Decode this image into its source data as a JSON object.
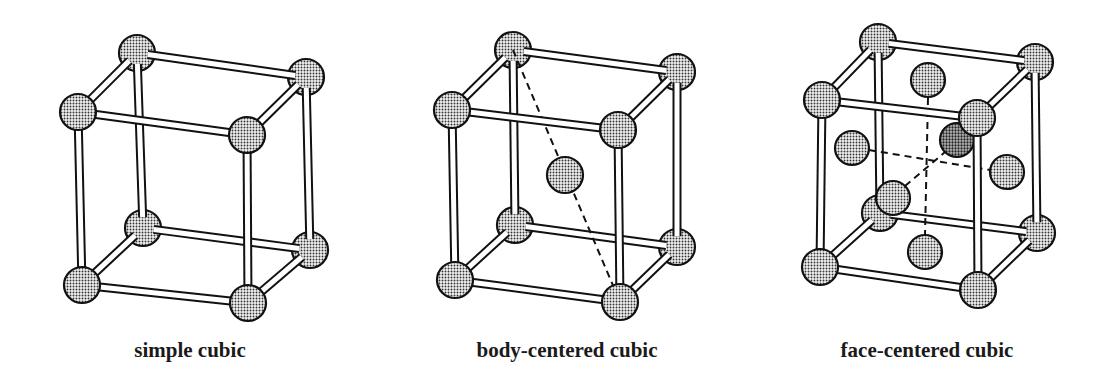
{
  "figure": {
    "panels": [
      {
        "id": "simple-cubic",
        "label": "simple cubic",
        "label_pos": [
          190,
          357
        ],
        "atom_radius": 18,
        "corners": {
          "tbl": [
            137,
            53
          ],
          "tbr": [
            306,
            77
          ],
          "tfl": [
            78,
            112
          ],
          "tfr": [
            247,
            135
          ],
          "bbl": [
            143,
            228
          ],
          "bbr": [
            310,
            250
          ],
          "bfl": [
            82,
            285
          ],
          "bfr": [
            248,
            303
          ]
        },
        "extra_atoms": [],
        "dashes": []
      },
      {
        "id": "body-centered-cubic",
        "label": "body-centered cubic",
        "label_pos": [
          567,
          357
        ],
        "atom_radius": 18,
        "corners": {
          "tbl": [
            513,
            50
          ],
          "tbr": [
            677,
            72
          ],
          "tfl": [
            452,
            110
          ],
          "tfr": [
            618,
            130
          ],
          "bbl": [
            515,
            225
          ],
          "bbr": [
            677,
            247
          ],
          "bfl": [
            455,
            280
          ],
          "bfr": [
            620,
            302
          ]
        },
        "extra_atoms": [
          {
            "name": "body-center-atom",
            "pos": [
              565,
              175
            ],
            "r": 18
          }
        ],
        "dashes": [
          {
            "from": [
              513,
              50
            ],
            "to": [
              620,
              302
            ]
          }
        ]
      },
      {
        "id": "face-centered-cubic",
        "label": "face-centered cubic",
        "label_pos": [
          927,
          357
        ],
        "atom_radius": 18,
        "corners": {
          "tbl": [
            878,
            42
          ],
          "tbr": [
            1035,
            62
          ],
          "tfl": [
            822,
            100
          ],
          "tfr": [
            977,
            118
          ],
          "bbl": [
            880,
            213
          ],
          "bbr": [
            1037,
            233
          ],
          "bfl": [
            820,
            267
          ],
          "bfr": [
            978,
            290
          ]
        },
        "extra_atoms": [
          {
            "name": "top-face-atom",
            "pos": [
              928,
              80
            ],
            "r": 17
          },
          {
            "name": "back-face-atom",
            "pos": [
              957,
              140
            ],
            "r": 17,
            "dark": true
          },
          {
            "name": "left-face-atom",
            "pos": [
              852,
              148
            ],
            "r": 17
          },
          {
            "name": "right-face-atom",
            "pos": [
              1007,
              172
            ],
            "r": 17
          },
          {
            "name": "bottom-face-atom",
            "pos": [
              925,
              252
            ],
            "r": 17
          },
          {
            "name": "front-face-atom",
            "pos": [
              893,
              198
            ],
            "r": 17
          }
        ],
        "dashes": [
          {
            "from": [
              928,
              98
            ],
            "to": [
              925,
              235
            ]
          },
          {
            "from": [
              869,
              150
            ],
            "to": [
              990,
              170
            ]
          },
          {
            "from": [
              905,
              186
            ],
            "to": [
              945,
              152
            ]
          }
        ]
      }
    ]
  },
  "colors": {
    "line": "#111111",
    "atom_fill": "#bdbdbd",
    "atom_dark_fill": "#8a8a8a",
    "background": "#ffffff"
  }
}
